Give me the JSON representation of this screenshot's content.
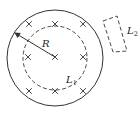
{
  "diagram": {
    "type": "physics-magnetic-field-region",
    "field_symbol": "×",
    "field_marks": [
      {
        "x": 29,
        "y": 24
      },
      {
        "x": 55,
        "y": 24
      },
      {
        "x": 83,
        "y": 24
      },
      {
        "x": 28,
        "y": 57
      },
      {
        "x": 55,
        "y": 57
      },
      {
        "x": 83,
        "y": 57
      },
      {
        "x": 29,
        "y": 91
      },
      {
        "x": 55,
        "y": 91
      },
      {
        "x": 83,
        "y": 91
      }
    ],
    "outer_circle": {
      "cx": 55,
      "cy": 58,
      "r": 48
    },
    "inner_loop": {
      "cx": 55,
      "cy": 58,
      "r": 32,
      "label": "L",
      "label_sub": "1"
    },
    "radius_label": "R",
    "outer_loop": {
      "label": "L",
      "label_sub": "2"
    },
    "colors": {
      "stroke": "#333333",
      "background": "#ffffff"
    }
  }
}
